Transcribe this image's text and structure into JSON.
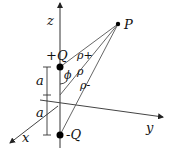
{
  "diagram": {
    "title": "",
    "labels": {
      "z_axis": "z",
      "y_axis": "y",
      "x_axis": "x",
      "point": "P",
      "positive_charge": "+Q",
      "negative_charge": "-Q",
      "rho_plus": "ρ+",
      "rho": "ρ",
      "rho_minus": "ρ-",
      "angle": "ϕ",
      "upper_a": "a",
      "lower_a": "a"
    },
    "colors": {
      "line": "#222222",
      "charge": "#000000"
    }
  }
}
